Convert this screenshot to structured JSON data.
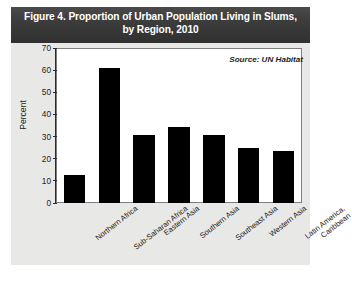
{
  "figure": {
    "title_line1": "Figure 4. Proportion of Urban Population Living in Slums,",
    "title_line2": "by Region, 2010",
    "source": "Source: UN Habitat",
    "header_color": "#3c3c3c",
    "panel_color": "#e8e8e6",
    "bar_color": "#000000",
    "plot_background": "#ffffff"
  },
  "chart_data": {
    "type": "bar",
    "title": "Figure 4. Proportion of Urban Population Living in Slums, by Region, 2010",
    "xlabel": "",
    "ylabel": "Percent",
    "ylim": [
      0,
      70
    ],
    "yticks": [
      0,
      10,
      20,
      30,
      40,
      50,
      60,
      70
    ],
    "ytick_labels": [
      "0",
      "10",
      "20",
      "30",
      "40",
      "50",
      "60",
      "70"
    ],
    "grid": false,
    "legend": "none",
    "annotations": [
      "Source: UN Habitat"
    ],
    "categories": [
      "Northern Africa",
      "Sub-Saharan Africa",
      "Eastern Asia",
      "Southern Asia",
      "Southeast Asia",
      "Western Asia",
      "Latin America, Caribbean"
    ],
    "category_lines": [
      [
        "Northern Africa"
      ],
      [
        "Sub-Saharan Africa"
      ],
      [
        "Eastern Asia"
      ],
      [
        "Southern Asia"
      ],
      [
        "Southeast Asia"
      ],
      [
        "Western Asia"
      ],
      [
        "Latin America,",
        "Caribbean"
      ]
    ],
    "values": [
      13,
      62,
      31,
      35,
      31,
      25,
      24
    ]
  }
}
